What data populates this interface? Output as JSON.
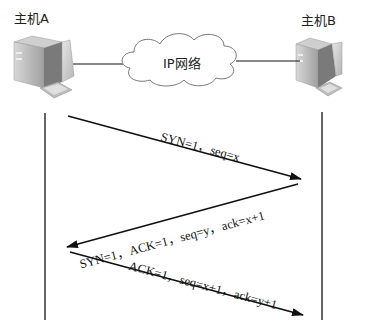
{
  "hosts": {
    "a": {
      "label": "主机A",
      "icon": "desktop-computer-icon"
    },
    "b": {
      "label": "主机B",
      "icon": "desktop-computer-icon"
    }
  },
  "network": {
    "label": "IP网络",
    "icon": "cloud-icon"
  },
  "messages": [
    {
      "label": "SYN=1，seq=x",
      "direction": "A→B"
    },
    {
      "label": "SYN=1，ACK=1，seq=y，ack=x+1",
      "direction": "B→A"
    },
    {
      "label": "ACK=1，seq=x+1，ack=y+1",
      "direction": "A→B"
    }
  ],
  "colors": {
    "line": "#111111",
    "cloud_stroke": "#777777",
    "computer_body": "#9a9a9a"
  }
}
